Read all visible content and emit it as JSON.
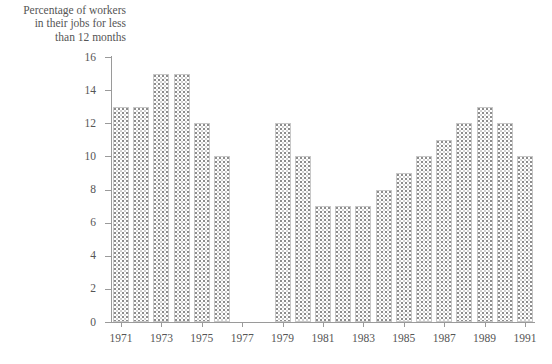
{
  "chart_data": {
    "type": "bar",
    "title": "Percentage of workers\nin their jobs for less\nthan 12 months",
    "xlabel": "",
    "ylabel": "",
    "ylim": [
      0,
      16
    ],
    "ytick_labels": [
      "0",
      "2",
      "4",
      "6",
      "8",
      "10",
      "12",
      "14",
      "16"
    ],
    "ytick_values": [
      0,
      2,
      4,
      6,
      8,
      10,
      12,
      14,
      16
    ],
    "xtick_labels": [
      "1971",
      "1973",
      "1975",
      "1977",
      "1979",
      "1981",
      "1983",
      "1985",
      "1987",
      "1989",
      "1991"
    ],
    "grid": false,
    "legend": null,
    "categories": [
      "1971",
      "1972",
      "1973",
      "1974",
      "1975",
      "1976",
      "1977",
      "1978",
      "1979",
      "1980",
      "1981",
      "1982",
      "1983",
      "1984",
      "1985",
      "1986",
      "1987",
      "1988",
      "1989",
      "1990",
      "1991"
    ],
    "values": [
      13,
      13,
      15,
      15,
      12,
      10,
      null,
      null,
      12,
      10,
      7,
      7,
      7,
      8,
      9,
      10,
      11,
      12,
      13,
      12,
      10
    ],
    "missing_note": "No data for 1977 and 1978",
    "bar_fill_color": "#ffffff",
    "bar_pattern": "fine dotted checker",
    "bar_edge_color": "#c8c8c8",
    "axis_color": "#9a9a9a",
    "text_color": "#555555"
  }
}
